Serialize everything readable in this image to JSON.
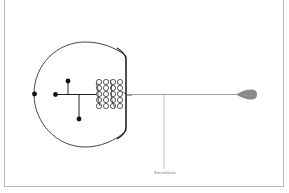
{
  "diagram": {
    "type": "neuron-schematic",
    "labels": {
      "excitation": "Excitation"
    },
    "parts": [
      {
        "name": "cell-body",
        "shape": "rounded-soma"
      },
      {
        "name": "dendrite-branches",
        "terminals": 4
      },
      {
        "name": "coiled-structure",
        "shape": "mesh-coil"
      },
      {
        "name": "axon",
        "shape": "horizontal-line"
      },
      {
        "name": "axon-terminal",
        "shape": "teardrop"
      },
      {
        "name": "excitation-lead",
        "shape": "vertical-line"
      }
    ],
    "colors": {
      "stroke": "#333333",
      "axon": "#888888",
      "terminal": "#8a8a8a",
      "frame": "#b8b8b8",
      "label": "#777777"
    }
  }
}
